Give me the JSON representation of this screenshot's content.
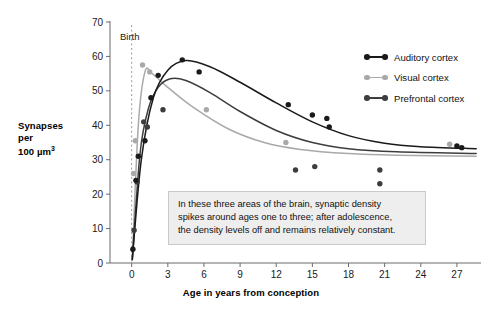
{
  "chart_data": {
    "type": "scatter",
    "title": "",
    "xlabel": "Age in years from conception",
    "ylabel": "Synapses\nper\n100 µm³",
    "ylabel_lines": [
      "Synapses",
      "per",
      "100 µm³"
    ],
    "xlim": [
      -1.8,
      29
    ],
    "ylim": [
      0,
      70
    ],
    "xticks": [
      0,
      3,
      6,
      9,
      12,
      15,
      18,
      21,
      24,
      27
    ],
    "yticks": [
      0,
      10,
      20,
      30,
      40,
      50,
      60,
      70
    ],
    "grid": false,
    "legend_position": "top-right",
    "annotations": [
      {
        "name": "birth-marker",
        "label": "Birth",
        "x": 0,
        "style": "vertical dashed line"
      },
      {
        "name": "callout-box",
        "text": "In these three areas of the brain, synaptic density spikes around ages one to three; after adolescence, the density levels off and remains relatively constant.",
        "lines": [
          "In these three areas of the brain, synaptic density",
          "spikes around ages one to three; after adolescence,",
          "the density levels off and remains relatively constant."
        ]
      }
    ],
    "series": [
      {
        "name": "Auditory cortex",
        "color": "#1a1a1a",
        "points": [
          {
            "x": 0.1,
            "y": 4.0
          },
          {
            "x": 0.35,
            "y": 24.0
          },
          {
            "x": 0.55,
            "y": 31.0
          },
          {
            "x": 1.1,
            "y": 35.5
          },
          {
            "x": 1.6,
            "y": 48.0
          },
          {
            "x": 2.2,
            "y": 54.5
          },
          {
            "x": 4.2,
            "y": 59.0
          },
          {
            "x": 5.6,
            "y": 55.5
          },
          {
            "x": 13.0,
            "y": 46.0
          },
          {
            "x": 15.0,
            "y": 43.0
          },
          {
            "x": 16.2,
            "y": 42.0
          },
          {
            "x": 16.4,
            "y": 39.5
          },
          {
            "x": 27.0,
            "y": 34.0
          },
          {
            "x": 27.4,
            "y": 33.5
          }
        ],
        "curve": [
          {
            "x": 0.05,
            "y": 1.0
          },
          {
            "x": 0.8,
            "y": 30.0
          },
          {
            "x": 1.8,
            "y": 48.0
          },
          {
            "x": 3.0,
            "y": 56.0
          },
          {
            "x": 4.5,
            "y": 58.8
          },
          {
            "x": 6.5,
            "y": 57.0
          },
          {
            "x": 9.0,
            "y": 52.5
          },
          {
            "x": 12.0,
            "y": 46.5
          },
          {
            "x": 15.0,
            "y": 41.0
          },
          {
            "x": 18.0,
            "y": 37.0
          },
          {
            "x": 21.0,
            "y": 34.8
          },
          {
            "x": 24.0,
            "y": 33.8
          },
          {
            "x": 28.6,
            "y": 33.2
          }
        ]
      },
      {
        "name": "Visual cortex",
        "color": "#a9a9a9",
        "points": [
          {
            "x": 0.15,
            "y": 26.0
          },
          {
            "x": 0.3,
            "y": 35.5
          },
          {
            "x": 0.9,
            "y": 57.5
          },
          {
            "x": 1.5,
            "y": 55.5
          },
          {
            "x": 6.2,
            "y": 44.5
          },
          {
            "x": 12.8,
            "y": 35.0
          },
          {
            "x": 26.4,
            "y": 34.5
          }
        ],
        "curve": [
          {
            "x": 0.05,
            "y": 1.0
          },
          {
            "x": 0.55,
            "y": 40.0
          },
          {
            "x": 1.1,
            "y": 55.5
          },
          {
            "x": 1.7,
            "y": 55.0
          },
          {
            "x": 3.0,
            "y": 51.0
          },
          {
            "x": 5.0,
            "y": 45.5
          },
          {
            "x": 8.0,
            "y": 39.0
          },
          {
            "x": 11.0,
            "y": 35.0
          },
          {
            "x": 14.0,
            "y": 33.0
          },
          {
            "x": 18.0,
            "y": 31.8
          },
          {
            "x": 22.0,
            "y": 31.3
          },
          {
            "x": 28.6,
            "y": 31.0
          }
        ]
      },
      {
        "name": "Prefrontal cortex",
        "color": "#3d3d3d",
        "points": [
          {
            "x": 0.2,
            "y": 9.5
          },
          {
            "x": 0.45,
            "y": 23.5
          },
          {
            "x": 1.0,
            "y": 41.0
          },
          {
            "x": 1.3,
            "y": 39.5
          },
          {
            "x": 2.6,
            "y": 44.5
          },
          {
            "x": 13.6,
            "y": 27.0
          },
          {
            "x": 15.2,
            "y": 28.0
          },
          {
            "x": 20.6,
            "y": 27.0
          },
          {
            "x": 20.6,
            "y": 23.0
          }
        ],
        "curve": [
          {
            "x": 0.05,
            "y": 1.0
          },
          {
            "x": 0.7,
            "y": 32.0
          },
          {
            "x": 1.4,
            "y": 45.0
          },
          {
            "x": 2.2,
            "y": 51.0
          },
          {
            "x": 3.2,
            "y": 53.5
          },
          {
            "x": 4.5,
            "y": 53.0
          },
          {
            "x": 6.5,
            "y": 49.5
          },
          {
            "x": 9.0,
            "y": 44.0
          },
          {
            "x": 12.0,
            "y": 38.5
          },
          {
            "x": 15.0,
            "y": 35.0
          },
          {
            "x": 18.0,
            "y": 33.2
          },
          {
            "x": 22.0,
            "y": 32.3
          },
          {
            "x": 28.6,
            "y": 31.8
          }
        ]
      }
    ]
  },
  "legend": {
    "items": [
      {
        "label": "Auditory cortex",
        "color": "#1a1a1a"
      },
      {
        "label": "Visual cortex",
        "color": "#a9a9a9"
      },
      {
        "label": "Prefrontal cortex",
        "color": "#3d3d3d"
      }
    ]
  },
  "axes": {
    "x_title": "Age in years from conception",
    "y_title_line1": "Synapses",
    "y_title_line2": "per",
    "y_title_line3": "100 µm³"
  },
  "birth": {
    "label": "Birth"
  },
  "annotation": {
    "line1": "In these three areas of the brain, synaptic density",
    "line2": "spikes around ages one to three; after adolescence,",
    "line3": "the density levels off and remains relatively constant."
  },
  "colors": {
    "axis": "#6b6b6b",
    "text": "#111111",
    "annotation_bg": "#eeeeee",
    "annotation_border": "#c9c9c9"
  }
}
